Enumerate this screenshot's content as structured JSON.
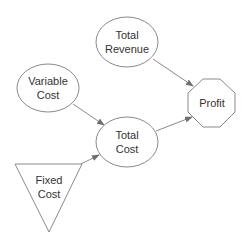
{
  "diagram": {
    "type": "influence-diagram",
    "nodes": [
      {
        "id": "total_revenue",
        "shape": "ellipse",
        "lines": [
          "Total",
          "Revenue"
        ]
      },
      {
        "id": "variable_cost",
        "shape": "ellipse",
        "lines": [
          "Variable",
          "Cost"
        ]
      },
      {
        "id": "total_cost",
        "shape": "ellipse",
        "lines": [
          "Total",
          "Cost"
        ]
      },
      {
        "id": "profit",
        "shape": "octagon",
        "lines": [
          "Profit"
        ]
      },
      {
        "id": "fixed_cost",
        "shape": "triangle",
        "lines": [
          "Fixed",
          "Cost"
        ]
      }
    ],
    "edges": [
      {
        "from": "total_revenue",
        "to": "profit"
      },
      {
        "from": "variable_cost",
        "to": "total_cost"
      },
      {
        "from": "fixed_cost",
        "to": "total_cost"
      },
      {
        "from": "total_cost",
        "to": "profit"
      }
    ],
    "colors": {
      "stroke": "#8a8a8a",
      "text": "#333333",
      "background": "#ffffff"
    }
  }
}
